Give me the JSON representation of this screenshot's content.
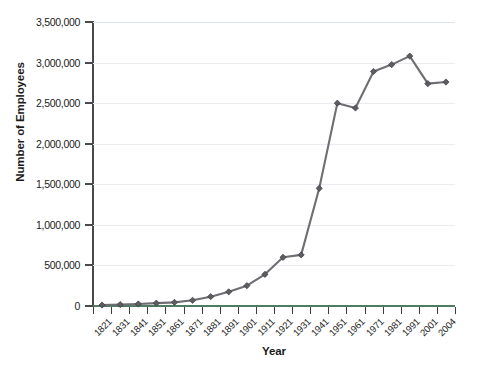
{
  "chart_data": {
    "type": "line",
    "title": "",
    "xlabel": "Year",
    "ylabel": "Number of Employees",
    "categories": [
      "1821",
      "1831",
      "1841",
      "1851",
      "1861",
      "1871",
      "1881",
      "1891",
      "1901",
      "1911",
      "1921",
      "1931",
      "1941",
      "1951",
      "1961",
      "1971",
      "1981",
      "1991",
      "2001",
      "2004"
    ],
    "values": [
      12000,
      18000,
      25000,
      35000,
      45000,
      70000,
      115000,
      175000,
      250000,
      390000,
      600000,
      630000,
      1450000,
      2500000,
      2440000,
      2890000,
      2975000,
      3080000,
      2740000,
      2760000
    ],
    "series": [
      {
        "name": "Number of Employees",
        "values": [
          12000,
          18000,
          25000,
          35000,
          45000,
          70000,
          115000,
          175000,
          250000,
          390000,
          600000,
          630000,
          1450000,
          2500000,
          2440000,
          2890000,
          2975000,
          3080000,
          2740000,
          2760000
        ]
      }
    ],
    "ylim": [
      0,
      3500000
    ],
    "y_ticks": [
      0,
      500000,
      1000000,
      1500000,
      2000000,
      2500000,
      3000000,
      3500000
    ],
    "y_tick_labels": [
      "0",
      "500,000",
      "1,000,000",
      "1,500,000",
      "2,000,000",
      "2,500,000",
      "3,000,000",
      "3,500,000"
    ],
    "grid": true,
    "legend": false,
    "legend_position": "none",
    "marker": "diamond",
    "line_color": "#6e6e73",
    "marker_color": "#5c5c62",
    "grid_color": "#e9edf1",
    "axis_color": "#4a4a4a",
    "x_axis_color": "#4f7c63",
    "background_color": "#ffffff"
  }
}
